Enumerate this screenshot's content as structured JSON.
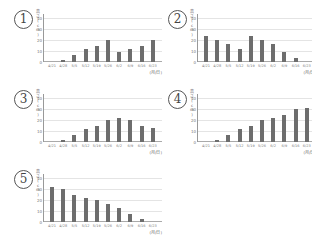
{
  "chart_data": [
    {
      "id": "1",
      "type": "bar",
      "title": "①",
      "xlabel": "(月/日)",
      "ylabel": "高さ(cm)",
      "ylim": [
        0,
        40
      ],
      "yticks": [
        0,
        10,
        20,
        30,
        40
      ],
      "grid": true,
      "categories": [
        "4/21",
        "4/28",
        "5/5",
        "5/12",
        "5/19",
        "5/26",
        "6/2",
        "6/9",
        "6/16",
        "6/23"
      ],
      "values": [
        0,
        2,
        6,
        12,
        15,
        20,
        9,
        12,
        15,
        20
      ]
    },
    {
      "id": "2",
      "type": "bar",
      "title": "②",
      "xlabel": "(月/日)",
      "ylabel": "高さ(cm)",
      "ylim": [
        0,
        40
      ],
      "yticks": [
        0,
        10,
        20,
        30,
        40
      ],
      "grid": true,
      "categories": [
        "4/21",
        "4/28",
        "5/5",
        "5/12",
        "5/19",
        "5/26",
        "6/2",
        "6/9",
        "6/16",
        "6/23"
      ],
      "values": [
        24,
        20,
        16,
        12,
        24,
        20,
        16,
        9,
        4,
        0
      ]
    },
    {
      "id": "3",
      "type": "bar",
      "title": "③",
      "xlabel": "(月/日)",
      "ylabel": "高さ(cm)",
      "ylim": [
        0,
        40
      ],
      "yticks": [
        0,
        10,
        20,
        30,
        40
      ],
      "grid": true,
      "categories": [
        "4/21",
        "4/28",
        "5/5",
        "5/12",
        "5/19",
        "5/26",
        "6/2",
        "6/9",
        "6/16",
        "6/23"
      ],
      "values": [
        0,
        2,
        6,
        12,
        15,
        20,
        22,
        20,
        15,
        13
      ]
    },
    {
      "id": "4",
      "type": "bar",
      "title": "④",
      "xlabel": "(月/日)",
      "ylabel": "高さ(cm)",
      "ylim": [
        0,
        40
      ],
      "yticks": [
        0,
        10,
        20,
        30,
        40
      ],
      "grid": true,
      "categories": [
        "4/21",
        "4/28",
        "5/5",
        "5/12",
        "5/19",
        "5/26",
        "6/2",
        "6/9",
        "6/16",
        "6/23"
      ],
      "values": [
        0,
        2,
        6,
        12,
        15,
        20,
        22,
        25,
        30,
        31
      ]
    },
    {
      "id": "5",
      "type": "bar",
      "title": "⑤",
      "xlabel": "(月/日)",
      "ylabel": "高さ(cm)",
      "ylim": [
        0,
        40
      ],
      "yticks": [
        0,
        10,
        20,
        30,
        40
      ],
      "grid": true,
      "categories": [
        "4/21",
        "4/28",
        "5/5",
        "5/12",
        "5/19",
        "5/26",
        "6/2",
        "6/9",
        "6/16",
        "6/23"
      ],
      "values": [
        32,
        30,
        25,
        22,
        20,
        16,
        13,
        7,
        3,
        0
      ]
    }
  ],
  "colors": {
    "bar": "#6d6d6d",
    "grid": "#e4e4e4",
    "axis": "#999999"
  }
}
